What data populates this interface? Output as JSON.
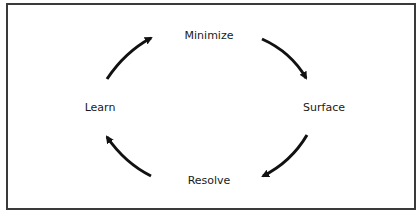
{
  "diagram": {
    "type": "cycle",
    "nodes": [
      {
        "id": "minimize",
        "label": "Minimize"
      },
      {
        "id": "surface",
        "label": "Surface"
      },
      {
        "id": "resolve",
        "label": "Resolve"
      },
      {
        "id": "learn",
        "label": "Learn"
      }
    ],
    "edges": [
      {
        "from": "learn",
        "to": "minimize"
      },
      {
        "from": "minimize",
        "to": "surface"
      },
      {
        "from": "surface",
        "to": "resolve"
      },
      {
        "from": "resolve",
        "to": "learn"
      }
    ],
    "direction": "clockwise"
  }
}
